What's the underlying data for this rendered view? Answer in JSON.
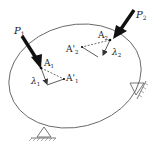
{
  "diagram": {
    "type": "mechanics-free-body",
    "colors": {
      "line": "#555555",
      "arrow": "#111111",
      "text": "#222222",
      "background": "#ffffff"
    },
    "labels": {
      "P1": "P",
      "P1_sub": "1",
      "P2": "P",
      "P2_sub": "2",
      "A1": "A",
      "A1_sub": "1",
      "A2": "A",
      "A2_sub": "2",
      "A1_prime": "A'",
      "A1_prime_sub": "1",
      "A2_prime": "A'",
      "A2_prime_sub": "2",
      "lambda1": "λ",
      "lambda1_sub": "1",
      "lambda2": "λ",
      "lambda2_sub": "2"
    },
    "forces": [
      {
        "name": "P1",
        "applied_at": "A1"
      },
      {
        "name": "P2",
        "applied_at": "A2"
      }
    ],
    "supports": [
      {
        "name": "bottom-pin-support",
        "position": "bottom"
      },
      {
        "name": "right-pin-support",
        "position": "right"
      }
    ]
  }
}
